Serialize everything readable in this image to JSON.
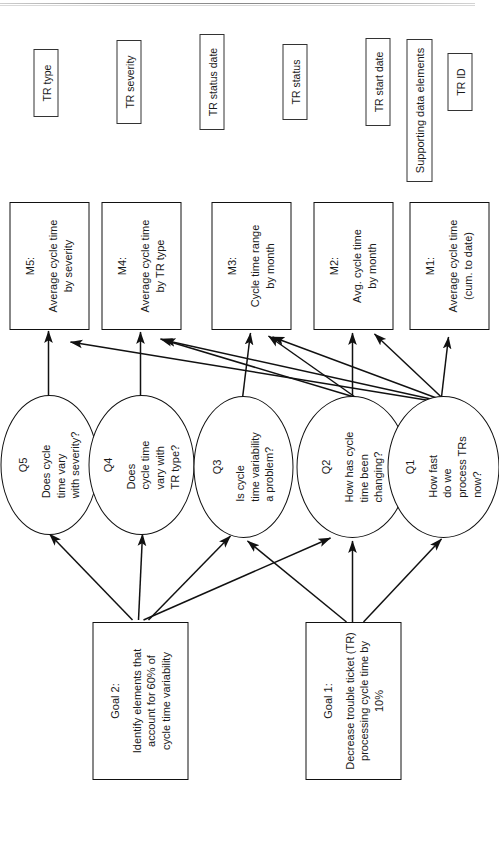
{
  "diagram": {
    "orientation": "rotated-90-ccw",
    "stroke_color": "#111111",
    "background_color": "#ffffff"
  },
  "goals": [
    {
      "id": "goal1",
      "title": "Goal 1:",
      "body": "Decrease trouble ticket (TR)\nprocessing cycle time by 10%"
    },
    {
      "id": "goal2",
      "title": "Goal 2:",
      "body": "Identify elements that\naccount for 60% of\ncycle time variability"
    }
  ],
  "questions": [
    {
      "id": "q1",
      "title": "Q1",
      "body": "How fast\ndo we\nprocess TRs\nnow?"
    },
    {
      "id": "q2",
      "title": "Q2",
      "body": "How has cycle\ntime been\nchanging?"
    },
    {
      "id": "q3",
      "title": "Q3",
      "body": "Is cycle\ntime variability\na problem?"
    },
    {
      "id": "q4",
      "title": "Q4",
      "body": "Does\ncycle time\nvary with\nTR type?"
    },
    {
      "id": "q5",
      "title": "Q5",
      "body": "Does cycle\ntime vary\nwith severity?"
    }
  ],
  "metrics": [
    {
      "id": "m1",
      "title": "M1:",
      "body": "Average cycle time\n(cum. to date)"
    },
    {
      "id": "m2",
      "title": "M2:",
      "body": "Avg. cycle time\nby month"
    },
    {
      "id": "m3",
      "title": "M3:",
      "body": "Cycle time range\nby month"
    },
    {
      "id": "m4",
      "title": "M4:",
      "body": "Average cycle time\nby TR type"
    },
    {
      "id": "m5",
      "title": "M5:",
      "body": "Average cycle time\nby severity"
    }
  ],
  "supporting": {
    "header": "Supporting data elements",
    "items": [
      {
        "id": "tr-id",
        "label": "TR ID"
      },
      {
        "id": "tr-start-date",
        "label": "TR start date"
      },
      {
        "id": "tr-status",
        "label": "TR status"
      },
      {
        "id": "tr-status-date",
        "label": "TR status date"
      },
      {
        "id": "tr-severity",
        "label": "TR severity"
      },
      {
        "id": "tr-type",
        "label": "TR type"
      }
    ]
  },
  "edges": [
    {
      "from": "goal1",
      "to": "q1"
    },
    {
      "from": "goal1",
      "to": "q2"
    },
    {
      "from": "goal1",
      "to": "q3"
    },
    {
      "from": "goal2",
      "to": "q2"
    },
    {
      "from": "goal2",
      "to": "q3"
    },
    {
      "from": "goal2",
      "to": "q4"
    },
    {
      "from": "goal2",
      "to": "q5"
    },
    {
      "from": "q1",
      "to": "m1"
    },
    {
      "from": "q1",
      "to": "m2"
    },
    {
      "from": "q1",
      "to": "m3"
    },
    {
      "from": "q1",
      "to": "m4"
    },
    {
      "from": "q1",
      "to": "m5"
    },
    {
      "from": "q2",
      "to": "m2"
    },
    {
      "from": "q2",
      "to": "m3"
    },
    {
      "from": "q2",
      "to": "m4"
    },
    {
      "from": "q3",
      "to": "m3"
    },
    {
      "from": "q4",
      "to": "m4"
    },
    {
      "from": "q5",
      "to": "m5"
    }
  ]
}
